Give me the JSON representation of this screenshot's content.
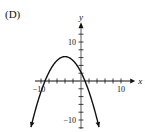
{
  "panel_label": "(D)",
  "chart_data": {
    "type": "line",
    "title": "",
    "xlabel": "x",
    "ylabel": "y",
    "xlim": [
      -12,
      12
    ],
    "ylim": [
      -12,
      12
    ],
    "x_tick_labels": [
      "-10",
      "10"
    ],
    "y_tick_labels": [
      "10",
      "-10"
    ],
    "tick_step": 2,
    "grid": false,
    "series": [
      {
        "name": "parabola",
        "equation": "y = -0.25(x + 9)(x - 1)",
        "vertex": [
          -4,
          6.25
        ],
        "x_intercepts": [
          -9,
          1
        ],
        "y_intercept": 2.25,
        "opens": "down",
        "x": [
          -12.5,
          -11,
          -9,
          -7,
          -5,
          -4,
          -3,
          -1,
          0,
          1,
          2,
          3,
          4.5
        ],
        "values": [
          -11.8,
          -7.5,
          0,
          4,
          6,
          6.25,
          6,
          4,
          2.25,
          0,
          -2.75,
          -6,
          -11.8
        ]
      }
    ]
  }
}
